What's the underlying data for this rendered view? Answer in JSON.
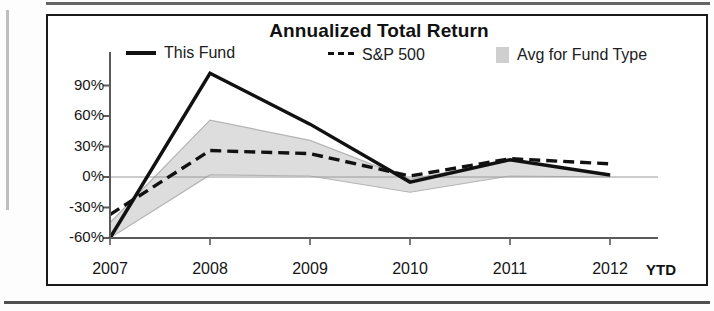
{
  "chart_data": {
    "type": "line",
    "title": "Annualized Total Return",
    "xlabel": "",
    "ylabel": "",
    "categories": [
      "2007",
      "2008",
      "2009",
      "2010",
      "2011",
      "2012"
    ],
    "x_axis_suffix": "YTD",
    "ylim": [
      -60,
      105
    ],
    "ytick_labels": [
      "90%",
      "60%",
      "30%",
      "0%",
      "-30%",
      "-60%"
    ],
    "ytick_values": [
      90,
      60,
      30,
      0,
      -30,
      -60
    ],
    "grid": false,
    "legend_position": "top",
    "series": [
      {
        "name": "This Fund",
        "style": "solid",
        "color": "#111111",
        "values": [
          -60,
          102,
          52,
          -5,
          17,
          2
        ]
      },
      {
        "name": "S&P 500",
        "style": "dashed",
        "color": "#111111",
        "values": [
          -37,
          26,
          23,
          1,
          18,
          13
        ]
      },
      {
        "name": "Avg for Fund Type",
        "style": "band",
        "color": "#d2d2d2",
        "upper": [
          -45,
          56,
          36,
          -2,
          16,
          3
        ],
        "lower": [
          -60,
          2,
          1,
          -15,
          1,
          0
        ]
      }
    ]
  },
  "chart": {
    "title": "Annualized Total Return",
    "legend": [
      {
        "label": "This Fund",
        "marker": "solid-line-swatch"
      },
      {
        "label": "S&P 500",
        "marker": "dashed-line-swatch"
      },
      {
        "label": "Avg for Fund Type",
        "marker": "shaded-box-swatch"
      }
    ],
    "y_axis": {
      "ticks": [
        "90%",
        "60%",
        "30%",
        "0%",
        "-30%",
        "-60%"
      ]
    },
    "x_axis": {
      "ticks": [
        "2007",
        "2008",
        "2009",
        "2010",
        "2011",
        "2012"
      ],
      "suffix": "YTD"
    }
  }
}
